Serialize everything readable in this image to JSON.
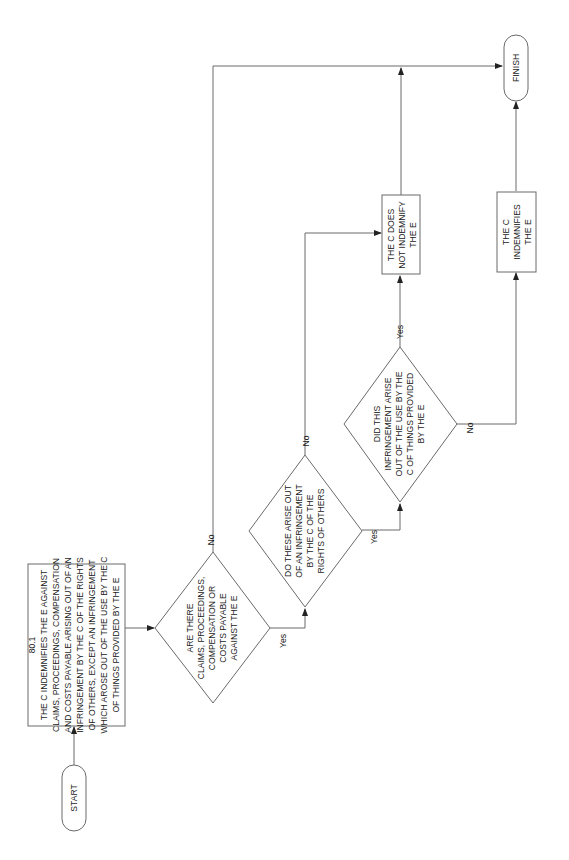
{
  "diagram": {
    "type": "flowchart",
    "orientation": "rotated -90 degrees (reads bottom-to-top)",
    "nodes": {
      "start": {
        "type": "terminal",
        "label": "START"
      },
      "rule": {
        "type": "process",
        "lines": [
          "80.1",
          "THE C INDEMNIFIES THE E AGAINST",
          "CLAIMS, PROCEEDINGS, COMPENSATION",
          "AND COSTS PAYABLE ARISING OUT OF AN",
          "INFRINGEMENT BY THE C OF THE RIGHTS",
          "OF OTHERS, EXCEPT AN INFRINGEMENT",
          "WHICH AROSE OUT OF THE USE BY THE C",
          "OF THINGS PROVIDED BY THE E"
        ]
      },
      "decision1": {
        "type": "decision",
        "lines": [
          "ARE THERE",
          "CLAIMS, PROCEEDINGS,",
          "COMPENSATION OR",
          "COSTS PAYABLE",
          "AGAINST THE E"
        ]
      },
      "decision2": {
        "type": "decision",
        "lines": [
          "DO THESE ARISE OUT",
          "OF AN INFRINGEMENT",
          "BY THE C OF THE",
          "RIGHTS OF OTHERS"
        ]
      },
      "decision3": {
        "type": "decision",
        "lines": [
          "DID THIS",
          "INFRINGEMENT ARISE",
          "OUT OF THE USE BY THE",
          "C OF THINGS PROVIDED",
          "BY THE E"
        ]
      },
      "not_indemnify": {
        "type": "process",
        "lines": [
          "THE C DOES",
          "NOT INDEMNIFY",
          "THE E"
        ]
      },
      "indemnifies": {
        "type": "process",
        "lines": [
          "THE C",
          "INDEMNIFIES",
          "THE E"
        ]
      },
      "finish": {
        "type": "terminal",
        "label": "FINISH"
      }
    },
    "edges": [
      {
        "from": "start",
        "to": "rule",
        "label": ""
      },
      {
        "from": "rule",
        "to": "decision1",
        "label": ""
      },
      {
        "from": "decision1",
        "to": "finish",
        "label": "No"
      },
      {
        "from": "decision1",
        "to": "decision2",
        "label": "Yes"
      },
      {
        "from": "decision2",
        "to": "not_indemnify",
        "label": "No"
      },
      {
        "from": "decision2",
        "to": "decision3",
        "label": "Yes"
      },
      {
        "from": "decision3",
        "to": "not_indemnify",
        "label": "Yes"
      },
      {
        "from": "decision3",
        "to": "indemnifies",
        "label": "No"
      },
      {
        "from": "not_indemnify",
        "to": "finish",
        "label": ""
      },
      {
        "from": "indemnifies",
        "to": "finish",
        "label": ""
      }
    ],
    "edge_labels": {
      "d1_no": "No",
      "d1_yes": "Yes",
      "d2_no": "No",
      "d2_yes": "Yes",
      "d3_yes": "Yes",
      "d3_no": "No"
    }
  }
}
